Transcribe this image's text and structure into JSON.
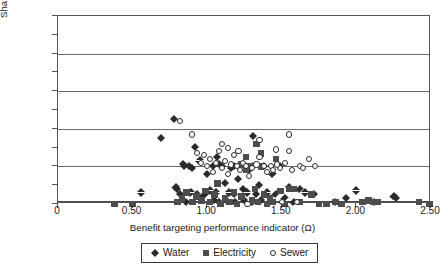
{
  "chart_data": {
    "type": "scatter",
    "title": "",
    "xlabel": "Benefit targeting performance indicator (Ω)",
    "ylabel": "Share of poor receiving subsidy (%)",
    "xlim": [
      0,
      2.5
    ],
    "ylim": [
      0,
      100
    ],
    "xticks": [
      "0",
      "0.50",
      "1.00",
      "1.50",
      "2.00",
      "2.50"
    ],
    "xtick_values": [
      0,
      0.5,
      1.0,
      1.5,
      2.0,
      2.5
    ],
    "yticks": [
      "0",
      "10",
      "20",
      "30",
      "40",
      "50",
      "60",
      "70",
      "80",
      "90",
      "100"
    ],
    "ytick_values": [
      0,
      10,
      20,
      30,
      40,
      50,
      60,
      70,
      80,
      90,
      100
    ],
    "gridlines": {
      "y": [
        0,
        20,
        40,
        60,
        80,
        100
      ],
      "x": []
    },
    "legend_position": "below-axis-center",
    "series": [
      {
        "name": "Water",
        "marker": "diamond",
        "color": "#2b2b2b",
        "points": [
          [
            0.56,
            6
          ],
          [
            0.69,
            35
          ],
          [
            0.78,
            45
          ],
          [
            0.79,
            9
          ],
          [
            0.8,
            8
          ],
          [
            0.82,
            5
          ],
          [
            0.84,
            21
          ],
          [
            0.85,
            20
          ],
          [
            0.86,
            1
          ],
          [
            0.88,
            20
          ],
          [
            0.89,
            6
          ],
          [
            0.9,
            19
          ],
          [
            0.92,
            30
          ],
          [
            0.93,
            5
          ],
          [
            0.95,
            23
          ],
          [
            0.97,
            4
          ],
          [
            0.99,
            5
          ],
          [
            1.0,
            16
          ],
          [
            1.02,
            7
          ],
          [
            1.04,
            20
          ],
          [
            1.05,
            2
          ],
          [
            1.06,
            6
          ],
          [
            1.07,
            25
          ],
          [
            1.08,
            1
          ],
          [
            1.1,
            20
          ],
          [
            1.12,
            11
          ],
          [
            1.13,
            2
          ],
          [
            1.15,
            6
          ],
          [
            1.16,
            19
          ],
          [
            1.18,
            5
          ],
          [
            1.19,
            1
          ],
          [
            1.21,
            13
          ],
          [
            1.22,
            20
          ],
          [
            1.24,
            8
          ],
          [
            1.25,
            2
          ],
          [
            1.27,
            6
          ],
          [
            1.28,
            18
          ],
          [
            1.3,
            1
          ],
          [
            1.31,
            20
          ],
          [
            1.33,
            5
          ],
          [
            1.35,
            10
          ],
          [
            1.36,
            2
          ],
          [
            1.38,
            20
          ],
          [
            1.4,
            6
          ],
          [
            1.42,
            1
          ],
          [
            1.44,
            16
          ],
          [
            1.31,
            36
          ],
          [
            1.08,
            21
          ],
          [
            1.18,
            20
          ],
          [
            1.46,
            5
          ],
          [
            1.49,
            20
          ],
          [
            1.52,
            3
          ],
          [
            1.55,
            9
          ],
          [
            1.58,
            1
          ],
          [
            1.62,
            8
          ],
          [
            1.66,
            6
          ],
          [
            1.72,
            5
          ],
          [
            1.86,
            1
          ],
          [
            1.93,
            3
          ],
          [
            2.0,
            7
          ],
          [
            2.12,
            1
          ],
          [
            2.25,
            4
          ],
          [
            2.27,
            3
          ]
        ]
      },
      {
        "name": "Electricity",
        "marker": "square",
        "color": "#4d4d4d",
        "points": [
          [
            0.38,
            0
          ],
          [
            0.5,
            0
          ],
          [
            0.8,
            1
          ],
          [
            0.83,
            3
          ],
          [
            0.86,
            6
          ],
          [
            0.9,
            1
          ],
          [
            0.93,
            4
          ],
          [
            0.96,
            2
          ],
          [
            0.99,
            7
          ],
          [
            1.02,
            1
          ],
          [
            1.05,
            5
          ],
          [
            1.07,
            11
          ],
          [
            1.09,
            0
          ],
          [
            1.12,
            3
          ],
          [
            1.15,
            1
          ],
          [
            1.18,
            6
          ],
          [
            1.2,
            0
          ],
          [
            1.23,
            4
          ],
          [
            1.26,
            25
          ],
          [
            1.28,
            20
          ],
          [
            1.3,
            2
          ],
          [
            1.32,
            8
          ],
          [
            1.34,
            1
          ],
          [
            1.36,
            27
          ],
          [
            1.38,
            5
          ],
          [
            1.4,
            0
          ],
          [
            1.42,
            3
          ],
          [
            1.33,
            32
          ],
          [
            1.29,
            20
          ],
          [
            1.44,
            1
          ],
          [
            1.46,
            24
          ],
          [
            1.49,
            7
          ],
          [
            1.52,
            0
          ],
          [
            1.55,
            8
          ],
          [
            1.58,
            8
          ],
          [
            1.62,
            1
          ],
          [
            1.7,
            5
          ],
          [
            1.75,
            0
          ],
          [
            1.8,
            0
          ],
          [
            1.86,
            1
          ],
          [
            1.9,
            0
          ],
          [
            2.04,
            1
          ],
          [
            2.08,
            2
          ],
          [
            2.11,
            1
          ],
          [
            2.14,
            1
          ],
          [
            2.42,
            1
          ],
          [
            2.49,
            0
          ],
          [
            1.23,
            21
          ],
          [
            1.26,
            18
          ],
          [
            1.36,
            20
          ]
        ]
      },
      {
        "name": "Sewer",
        "marker": "circle-open",
        "color": "#2b2b2b",
        "points": [
          [
            0.82,
            44
          ],
          [
            0.9,
            37
          ],
          [
            0.93,
            27
          ],
          [
            0.96,
            22
          ],
          [
            0.98,
            26
          ],
          [
            1.0,
            20
          ],
          [
            1.02,
            24
          ],
          [
            1.04,
            17
          ],
          [
            1.06,
            22
          ],
          [
            1.08,
            28
          ],
          [
            1.1,
            19
          ],
          [
            1.12,
            23
          ],
          [
            1.14,
            16
          ],
          [
            1.16,
            21
          ],
          [
            1.18,
            26
          ],
          [
            1.2,
            20
          ],
          [
            1.22,
            18
          ],
          [
            1.24,
            22
          ],
          [
            1.26,
            20
          ],
          [
            1.28,
            15
          ],
          [
            1.3,
            19
          ],
          [
            1.33,
            21
          ],
          [
            1.35,
            25
          ],
          [
            1.38,
            20
          ],
          [
            1.4,
            17
          ],
          [
            1.43,
            20
          ],
          [
            1.46,
            29
          ],
          [
            1.49,
            19
          ],
          [
            1.35,
            34
          ],
          [
            1.52,
            22
          ],
          [
            1.55,
            37
          ],
          [
            1.57,
            18
          ],
          [
            1.6,
            1
          ],
          [
            1.62,
            20
          ],
          [
            1.64,
            19
          ],
          [
            1.68,
            24
          ],
          [
            1.72,
            20
          ],
          [
            1.1,
            32
          ],
          [
            1.14,
            30
          ],
          [
            1.21,
            28
          ],
          [
            1.44,
            18
          ],
          [
            1.47,
            21
          ],
          [
            1.27,
            0
          ],
          [
            1.5,
            1
          ],
          [
            1.55,
            28
          ]
        ]
      }
    ]
  },
  "legend": {
    "items": [
      {
        "label": "Water"
      },
      {
        "label": "Electricity"
      },
      {
        "label": "Sewer"
      }
    ]
  }
}
